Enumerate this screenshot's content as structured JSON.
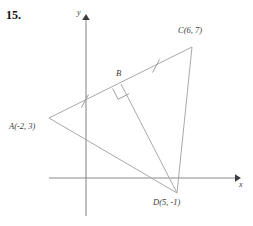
{
  "problem": {
    "number": "15."
  },
  "axes": {
    "x_label": "x",
    "y_label": "y",
    "origin_px": [
      86,
      178
    ],
    "x_axis_from_px": [
      49,
      178
    ],
    "x_axis_to_px": [
      238,
      178
    ],
    "y_axis_from_px": [
      86,
      16
    ],
    "y_axis_to_px": [
      86,
      216
    ],
    "arrow_color": "#444444",
    "axis_color": "#8a8a8a"
  },
  "figure": {
    "line_color": "#a9a9a9",
    "points": [
      {
        "id": "A",
        "label": "A(-2, 3)",
        "x_px": 49,
        "y_px": 118,
        "coord_x": -2,
        "coord_y": 3
      },
      {
        "id": "B",
        "label": "B",
        "x_px": 121,
        "y_px": 84,
        "coord_x": null,
        "coord_y": null
      },
      {
        "id": "C",
        "label": "C(6, 7)",
        "x_px": 192,
        "y_px": 47,
        "coord_x": 6,
        "coord_y": 7
      },
      {
        "id": "D",
        "label": "D(5, -1)",
        "x_px": 177,
        "y_px": 193,
        "coord_x": 5,
        "coord_y": -1
      }
    ],
    "segments": [
      {
        "name": "segment-AC",
        "from": "A",
        "to": "C"
      },
      {
        "name": "segment-CD",
        "from": "C",
        "to": "D"
      },
      {
        "name": "segment-AD",
        "from": "A",
        "to": "D"
      },
      {
        "name": "segment-BD",
        "from": "B",
        "to": "D"
      }
    ],
    "tick_marks": [
      {
        "name": "tick-AB",
        "on_segment": "segment-AC",
        "at_px": [
          85,
          101
        ]
      },
      {
        "name": "tick-BC",
        "on_segment": "segment-AC",
        "at_px": [
          156,
          66
        ]
      }
    ],
    "right_angle": {
      "name": "right-angle-marker",
      "at_vertex": "B",
      "size_px": 11
    }
  }
}
